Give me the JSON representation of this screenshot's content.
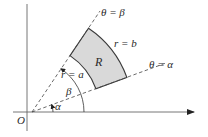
{
  "figure": {
    "type": "polar-rectangle-region",
    "origin_label": "O",
    "region_label": "R",
    "ray_beta_label": "θ = β",
    "ray_alpha_label": "θ = α",
    "outer_arc_label": "r = b",
    "inner_arc_label": "r = a",
    "angle_beta_label": "β",
    "angle_alpha_label": "α",
    "colors": {
      "region_fill": "#d9d9d9",
      "stroke": "#3a3a3a",
      "axis": "#555555",
      "background": "#ffffff"
    }
  }
}
